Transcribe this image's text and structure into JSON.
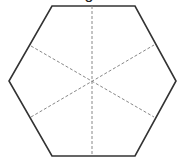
{
  "diagram": {
    "caption_fragment": "g",
    "shape": "regular-hexagon",
    "stroke_color": "#333333",
    "dash_color": "#888888",
    "vertices": [
      [
        52,
        6
      ],
      [
        135,
        6
      ],
      [
        176,
        81
      ],
      [
        135,
        156
      ],
      [
        52,
        156
      ],
      [
        9,
        81
      ]
    ],
    "center": [
      92,
      81
    ],
    "symmetry_lines": [
      {
        "from": [
          92,
          6
        ],
        "to": [
          92,
          156
        ],
        "orientation": "vertical"
      },
      {
        "from": [
          31,
          46
        ],
        "to": [
          154,
          117
        ],
        "orientation": "diagonal-down"
      },
      {
        "from": [
          31,
          117
        ],
        "to": [
          154,
          45
        ],
        "orientation": "diagonal-up"
      }
    ]
  }
}
